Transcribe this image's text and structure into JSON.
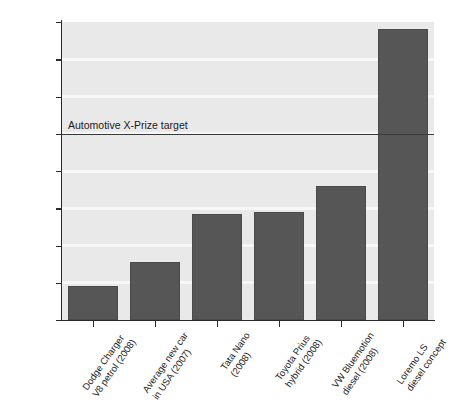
{
  "chart_data": {
    "type": "bar",
    "title": "",
    "xlabel": "",
    "ylabel": "Miles per gallon",
    "ylim": [
      0,
      160
    ],
    "yticks": [
      0,
      20,
      40,
      60,
      80,
      100,
      120,
      140,
      160
    ],
    "grid": true,
    "legend": null,
    "categories": [
      "Dodge Charger\nV8 petrol (2008)",
      "Average new car\nin USA (2007)",
      "Tata Nano\n(2008)",
      "Toyota Prius\nhybrid (2008)",
      "VW Bluemotion\ndiesel (2008)",
      "Loremo LS\ndiesel concept"
    ],
    "category_lines": [
      [
        "Dodge Charger",
        "V8 petrol (2008)"
      ],
      [
        "Average new car",
        "in USA (2007)"
      ],
      [
        "Tata Nano",
        "(2008)"
      ],
      [
        "Toyota Prius",
        "hybrid (2008)"
      ],
      [
        "VW Bluemotion",
        "diesel (2008)"
      ],
      [
        "Loremo LS",
        "diesel concept"
      ]
    ],
    "values": [
      18,
      31,
      57,
      58,
      72,
      156
    ],
    "annotations": [
      {
        "name": "automotive-x-prize-target",
        "label": "Automotive X-Prize target",
        "y": 100
      }
    ],
    "colors": {
      "bar": "#565656",
      "bar_border": "#4a4a4a",
      "plot_background": "#e9e9e9",
      "gridline": "#f7f7f7",
      "axis": "#2b2b2b",
      "threshold_line": "#3a3a3a",
      "text": "#1a1a1a",
      "page_background": "#ffffff"
    }
  }
}
